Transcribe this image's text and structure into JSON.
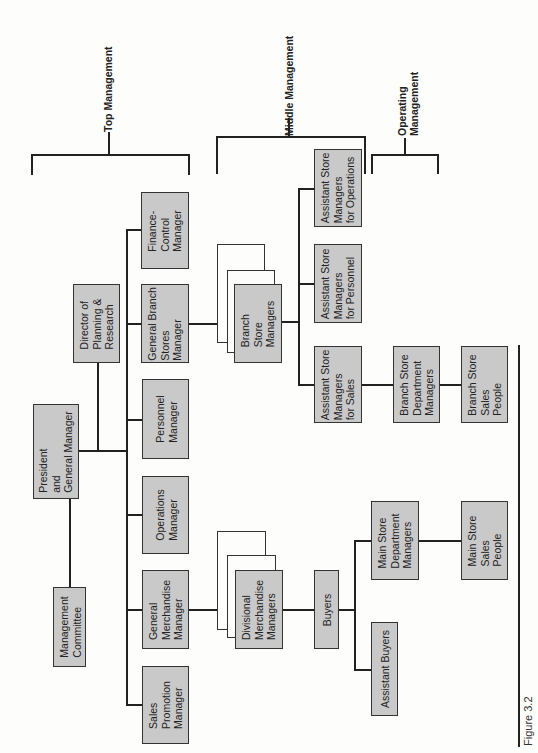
{
  "figure": {
    "caption": "Figure 3.2"
  },
  "tiers": {
    "top": "Top Management",
    "middle": "Middle Management",
    "operating": "Operating\nManagement"
  },
  "nodes": {
    "management_committee": "Management\nCommittee",
    "president": "President\nand\nGeneral Manager",
    "director_planning": "Director of\nPlanning &\nResearch",
    "finance_control": "Finance-\nControl\nManager",
    "general_branch_stores": "General Branch\nStores\nManager",
    "personnel": "Personnel\nManager",
    "operations": "Operations\nManager",
    "general_merchandise": "General\nMerchandise\nManager",
    "sales_promotion": "Sales\nPromotion\nManager",
    "branch_store_managers": "Branch\nStore\nManagers",
    "divisional_merchandise": "Divisional\nMerchandise\nManagers",
    "buyers": "Buyers",
    "assistant_buyers": "Assistant Buyers",
    "main_store_dept_managers": "Main Store\nDepartment\nManagers",
    "main_store_sales_people": "Main Store\nSales\nPeople",
    "asm_operations": "Assistant Store\nManagers\nfor Operations",
    "asm_personnel": "Assistant Store\nManagers\nfor Personnel",
    "asm_sales": "Assistant Store\nManagers\nfor Sales",
    "branch_dept_managers": "Branch Store\nDepartment\nManagers",
    "branch_sales_people": "Branch Store\nSales\nPeople"
  },
  "colors": {
    "box_fill": "#c9c9c9",
    "line": "#222222",
    "background": "#fdfdfb"
  }
}
